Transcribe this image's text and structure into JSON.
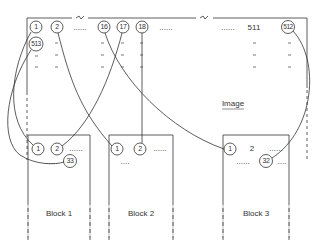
{
  "diagram": {
    "image": {
      "label": "Image",
      "top_row": [
        {
          "id": "c1",
          "text": "1",
          "circled": true
        },
        {
          "id": "c2",
          "text": "2",
          "circled": true
        },
        {
          "id": "d1",
          "text": "......"
        },
        {
          "id": "c16",
          "text": "16",
          "circled": true
        },
        {
          "id": "c17",
          "text": "17",
          "circled": true
        },
        {
          "id": "c18",
          "text": "18",
          "circled": true
        },
        {
          "id": "d2",
          "text": "......"
        },
        {
          "id": "d3",
          "text": "......"
        },
        {
          "id": "n511",
          "text": "511"
        },
        {
          "id": "c512",
          "text": "512",
          "circled": true
        }
      ],
      "second_row_first": {
        "text": "513",
        "circled": true
      }
    },
    "blocks": [
      {
        "label": "Block 1",
        "items": [
          "1",
          "2",
          "......",
          "......",
          "33"
        ]
      },
      {
        "label": "Block 2",
        "items": [
          "1",
          "2",
          "......",
          "...."
        ]
      },
      {
        "label": "Block 3",
        "items": [
          "1",
          "2",
          "......",
          "......",
          "32",
          "...."
        ]
      }
    ],
    "connections": [
      {
        "from": "Image 1",
        "to": "Block 1 · 1"
      },
      {
        "from": "Image 2",
        "to": "Block 3 · 1"
      },
      {
        "from": "Image 16",
        "to": "Block 3 · 1"
      },
      {
        "from": "Image 17",
        "to": "Block 1 · 2"
      },
      {
        "from": "Image 18",
        "to": "Block 2 · 2"
      },
      {
        "from": "Image 512",
        "to": "Block 3 · 32"
      },
      {
        "from": "Image 513",
        "to": "Block 1 · 33"
      }
    ]
  }
}
